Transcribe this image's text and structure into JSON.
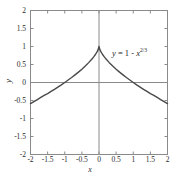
{
  "chart_data": {
    "type": "line",
    "title": "",
    "xlabel": "x",
    "ylabel": "y",
    "xlim": [
      -2,
      2
    ],
    "ylim": [
      -2,
      2
    ],
    "grid": false,
    "legend": "none",
    "annotation": {
      "text": "y = 1 - x^(2/3)",
      "lhs": "y",
      "equals": " = 1 - ",
      "base": "x",
      "exponent": "2/3"
    },
    "xticks": [
      -2,
      -1.5,
      -1,
      -0.5,
      0,
      0.5,
      1,
      1.5,
      2
    ],
    "xtick_labels": [
      "-2",
      "-1.5",
      "-1",
      "-0.5",
      "0",
      "0.5",
      "1",
      "1.5",
      "2"
    ],
    "yticks": [
      2,
      1.5,
      1,
      0.5,
      0,
      -0.5,
      -1,
      -1.5,
      -2
    ],
    "ytick_labels": [
      "2",
      "1.5",
      "1",
      "0.5",
      "0",
      "-0.5",
      "-1",
      "-1.5",
      "-2"
    ],
    "series": [
      {
        "name": "y = 1 - x^(2/3)",
        "color": "#4a4a4a",
        "x": [
          -2,
          -1.9,
          -1.8,
          -1.7,
          -1.6,
          -1.5,
          -1.4,
          -1.3,
          -1.2,
          -1.1,
          -1,
          -0.9,
          -0.8,
          -0.7,
          -0.6,
          -0.5,
          -0.4,
          -0.3,
          -0.2,
          -0.15,
          -0.1,
          -0.05,
          -0.02,
          0,
          0.02,
          0.05,
          0.1,
          0.15,
          0.2,
          0.3,
          0.4,
          0.5,
          0.6,
          0.7,
          0.8,
          0.9,
          1,
          1.1,
          1.2,
          1.3,
          1.4,
          1.5,
          1.6,
          1.7,
          1.8,
          1.9,
          2
        ],
        "y": [
          -0.587,
          -0.53,
          -0.473,
          -0.415,
          -0.357,
          -0.31,
          -0.249,
          -0.19,
          -0.129,
          -0.067,
          0,
          0.069,
          0.138,
          0.212,
          0.289,
          0.37,
          0.457,
          0.552,
          0.658,
          0.718,
          0.785,
          0.864,
          0.926,
          1,
          0.926,
          0.864,
          0.785,
          0.718,
          0.658,
          0.552,
          0.457,
          0.37,
          0.289,
          0.212,
          0.138,
          0.069,
          0,
          -0.067,
          -0.129,
          -0.19,
          -0.249,
          -0.31,
          -0.357,
          -0.415,
          -0.473,
          -0.53,
          -0.587
        ]
      }
    ],
    "axis_lines": {
      "x_axis_at_y": 0,
      "y_axis_at_x": 0,
      "color": "#8a8a8a"
    },
    "frame_color": "#8a8a8a"
  }
}
